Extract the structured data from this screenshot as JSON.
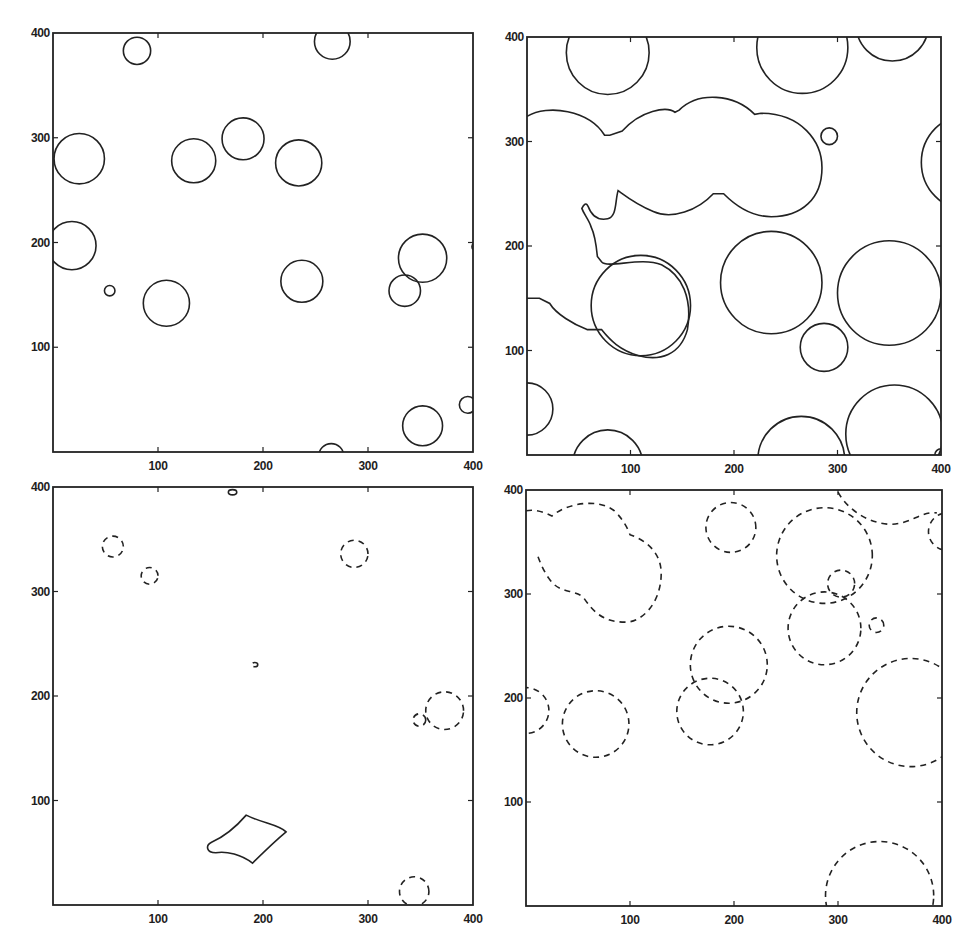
{
  "figure": {
    "line_color": "#222222",
    "background": "#ffffff"
  },
  "chart_data": [
    {
      "panel": "top-left",
      "type": "scatter",
      "title": "",
      "xlabel": "",
      "ylabel": "",
      "xlim": [
        0,
        400
      ],
      "ylim": [
        0,
        400
      ],
      "xticks": [
        "100",
        "200",
        "300",
        "400"
      ],
      "yticks": [
        "100",
        "200",
        "300",
        "400"
      ],
      "line_style": "solid",
      "shapes": [
        {
          "kind": "circle",
          "cx": 80,
          "cy": 383,
          "r": 13
        },
        {
          "kind": "circle",
          "cx": 266,
          "cy": 392,
          "r": 17
        },
        {
          "kind": "circle",
          "cx": 25,
          "cy": 280,
          "r": 24
        },
        {
          "kind": "circle",
          "cx": 134,
          "cy": 278,
          "r": 21
        },
        {
          "kind": "circle",
          "cx": 181,
          "cy": 299,
          "r": 20
        },
        {
          "kind": "circle",
          "cx": 234,
          "cy": 276,
          "r": 22
        },
        {
          "kind": "circle",
          "cx": 18,
          "cy": 197,
          "r": 23
        },
        {
          "kind": "circle",
          "cx": 54,
          "cy": 154,
          "r": 5
        },
        {
          "kind": "circle",
          "cx": 108,
          "cy": 142,
          "r": 22
        },
        {
          "kind": "circle",
          "cx": 237,
          "cy": 163,
          "r": 20
        },
        {
          "kind": "circle",
          "cx": 352,
          "cy": 185,
          "r": 23
        },
        {
          "kind": "circle",
          "cx": 335,
          "cy": 154,
          "r": 15
        },
        {
          "kind": "circle",
          "cx": 395,
          "cy": 45,
          "r": 8
        },
        {
          "kind": "circle",
          "cx": 352,
          "cy": 25,
          "r": 19
        },
        {
          "kind": "circle",
          "cx": 265,
          "cy": -4,
          "r": 12
        },
        {
          "kind": "circle",
          "cx": 402,
          "cy": 196,
          "r": 3
        }
      ]
    },
    {
      "panel": "top-right",
      "type": "scatter",
      "title": "",
      "xlabel": "",
      "ylabel": "",
      "xlim": [
        0,
        400
      ],
      "ylim": [
        0,
        400
      ],
      "xticks": [
        "100",
        "200",
        "300",
        "400"
      ],
      "yticks": [
        "100",
        "200",
        "300",
        "400"
      ],
      "line_style": "solid",
      "shapes": [
        {
          "kind": "circle",
          "cx": 78,
          "cy": 385,
          "r": 40
        },
        {
          "kind": "circle",
          "cx": 266,
          "cy": 390,
          "r": 44
        },
        {
          "kind": "circle",
          "cx": 353,
          "cy": 412,
          "r": 35
        },
        {
          "kind": "circle",
          "cx": 292,
          "cy": 305,
          "r": 8
        },
        {
          "kind": "circle",
          "cx": 236,
          "cy": 165,
          "r": 49
        },
        {
          "kind": "circle",
          "cx": 287,
          "cy": 103,
          "r": 23
        },
        {
          "kind": "circle",
          "cx": 110,
          "cy": 143,
          "r": 48
        },
        {
          "kind": "circle",
          "cx": 350,
          "cy": 155,
          "r": 50
        },
        {
          "kind": "circle",
          "cx": 0,
          "cy": 44,
          "r": 25
        },
        {
          "kind": "circle",
          "cx": 78,
          "cy": -10,
          "r": 34
        },
        {
          "kind": "circle",
          "cx": 265,
          "cy": -5,
          "r": 42
        },
        {
          "kind": "circle",
          "cx": 355,
          "cy": 20,
          "r": 47
        },
        {
          "kind": "circle",
          "cx": 427,
          "cy": 280,
          "r": 46
        },
        {
          "kind": "circle",
          "cx": 400,
          "cy": 0,
          "r": 6
        }
      ],
      "paths": [
        {
          "kind": "merged-blob",
          "d": "M0,324 C20,336 60,330 75,306 L80,306 L92,310 C110,330 135,334 143,328 L147,330 C165,348 200,346 220,326 L226,327 C265,327 285,300 285,275 C285,245 265,228 236,228 C215,228 200,240 190,250 L180,250 C165,234 140,225 122,233 C105,240 95,248 88,253 C85,243 87,228 78,226 C68,224 62,230 59,238 C57,242 55,240 53,236 C55,230 60,225 62,218 C66,210 67,200 68,190 L72,185 C78,178 110,190 130,182 C150,172 160,150 155,120 C148,95 128,90 108,95 C90,100 80,110 72,120 L58,120 C45,125 28,135 22,145 L12,150 L0,150"
        }
      ]
    },
    {
      "panel": "bottom-left",
      "type": "scatter",
      "title": "",
      "xlabel": "",
      "ylabel": "",
      "xlim": [
        0,
        400
      ],
      "ylim": [
        0,
        400
      ],
      "xticks": [
        "100",
        "200",
        "300",
        "400"
      ],
      "yticks": [
        "100",
        "200",
        "300",
        "400"
      ],
      "shapes": [
        {
          "kind": "ellipse",
          "cx": 171,
          "cy": 395,
          "rx": 4,
          "ry": 2.5,
          "style": "solid"
        },
        {
          "kind": "circle",
          "cx": 57,
          "cy": 343,
          "r": 10,
          "style": "dashed"
        },
        {
          "kind": "circle",
          "cx": 92,
          "cy": 315,
          "r": 8,
          "style": "dashed"
        },
        {
          "kind": "circle",
          "cx": 287,
          "cy": 336,
          "r": 13,
          "style": "dashed"
        },
        {
          "kind": "ellipse",
          "cx": 192,
          "cy": 230,
          "rx": 3,
          "ry": 2,
          "style": "dashed"
        },
        {
          "kind": "circle",
          "cx": 373,
          "cy": 186,
          "r": 18,
          "style": "dashed"
        },
        {
          "kind": "circle",
          "cx": 349,
          "cy": 177,
          "r": 6,
          "style": "dashed"
        },
        {
          "kind": "circle",
          "cx": 344,
          "cy": 13,
          "r": 14,
          "style": "dashed"
        }
      ],
      "paths": [
        {
          "kind": "diamond-blob",
          "style": "solid",
          "d": "M184,86 C200,78 215,77 222,70 C210,60 200,50 190,40 C180,48 165,52 155,50 C146,50 145,57 151,60 C162,65 172,72 184,86 Z"
        }
      ]
    },
    {
      "panel": "bottom-right",
      "type": "scatter",
      "title": "",
      "xlabel": "",
      "ylabel": "",
      "xlim": [
        0,
        400
      ],
      "ylim": [
        0,
        400
      ],
      "xticks": [
        "100",
        "200",
        "300",
        "400"
      ],
      "yticks": [
        "100",
        "200",
        "300",
        "400"
      ],
      "line_style": "dashed",
      "shapes": [
        {
          "kind": "circle",
          "cx": 197,
          "cy": 364,
          "r": 24
        },
        {
          "kind": "circle",
          "cx": 287,
          "cy": 337,
          "r": 46
        },
        {
          "kind": "circle",
          "cx": 303,
          "cy": 310,
          "r": 13
        },
        {
          "kind": "circle",
          "cx": 287,
          "cy": 267,
          "r": 35
        },
        {
          "kind": "circle",
          "cx": 337,
          "cy": 270,
          "r": 7
        },
        {
          "kind": "circle",
          "cx": 67,
          "cy": 175,
          "r": 32
        },
        {
          "kind": "circle",
          "cx": 195,
          "cy": 232,
          "r": 37
        },
        {
          "kind": "circle",
          "cx": 177,
          "cy": 187,
          "r": 32
        },
        {
          "kind": "circle",
          "cx": 370,
          "cy": 186,
          "r": 52
        },
        {
          "kind": "circle",
          "cx": 340,
          "cy": 10,
          "r": 52
        },
        {
          "kind": "circle",
          "cx": 0,
          "cy": 188,
          "r": 22
        },
        {
          "kind": "circle",
          "cx": 405,
          "cy": 360,
          "r": 18
        }
      ],
      "paths": [
        {
          "kind": "merged-blob",
          "d": "M0,380 C10,382 18,378 25,375 C40,388 70,392 85,380 C95,370 98,362 100,357 C115,352 130,340 130,320 C130,290 110,272 95,273 C75,273 65,282 55,297 C45,305 32,300 22,315 C15,325 12,335 10,340"
        },
        {
          "kind": "top-right-arc",
          "d": "M300,398 C310,380 330,368 350,367 C370,367 380,380 395,378"
        }
      ]
    }
  ],
  "panels": {
    "tl": {
      "ticks": {
        "x": [
          "100",
          "200",
          "300",
          "400"
        ],
        "y": [
          "100",
          "200",
          "300",
          "400"
        ]
      }
    },
    "tr": {
      "ticks": {
        "x": [
          "100",
          "200",
          "300",
          "400"
        ],
        "y": [
          "100",
          "200",
          "300",
          "400"
        ]
      }
    },
    "bl": {
      "ticks": {
        "x": [
          "100",
          "200",
          "300",
          "400"
        ],
        "y": [
          "100",
          "200",
          "300",
          "400"
        ]
      }
    },
    "br": {
      "ticks": {
        "x": [
          "100",
          "200",
          "300",
          "400"
        ],
        "y": [
          "100",
          "200",
          "300",
          "400"
        ]
      }
    }
  }
}
